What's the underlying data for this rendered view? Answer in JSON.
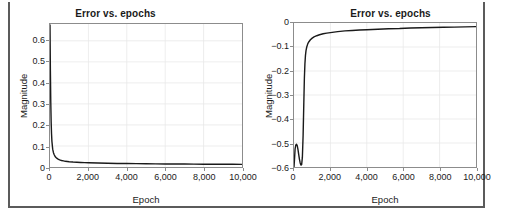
{
  "page": {
    "background_color": "#ffffff",
    "rule_color": "#5b5b5b"
  },
  "axis_color": "#8c8c8c",
  "grid_color": "#e8e8e8",
  "curve_color": "#1a1a1a",
  "figures": [
    {
      "id": "left",
      "title": "Error vs. epochs",
      "xlabel": "Epoch",
      "ylabel": "Magnitude",
      "xticks": [
        "0",
        "2,000",
        "4,000",
        "6,000",
        "8,000",
        "10,000"
      ],
      "yticks": [
        "0",
        "0.1",
        "0.2",
        "0.3",
        "0.4",
        "0.5",
        "0.6"
      ]
    },
    {
      "id": "right",
      "title": "Error vs. epochs",
      "xlabel": "Epoch",
      "ylabel": "Magnitude",
      "xticks": [
        "0",
        "2,000",
        "4,000",
        "6,000",
        "8,000",
        "10,000"
      ],
      "yticks": [
        "0",
        "−0.1",
        "−0.2",
        "−0.3",
        "−0.4",
        "−0.5",
        "−0.6"
      ]
    }
  ],
  "chart_data": [
    {
      "type": "line",
      "id": "left",
      "title": "Error vs. epochs",
      "xlabel": "Epoch",
      "ylabel": "Magnitude",
      "xlim": [
        0,
        10000
      ],
      "ylim": [
        0,
        0.68
      ],
      "xticks": [
        0,
        2000,
        4000,
        6000,
        8000,
        10000
      ],
      "yticks": [
        0,
        0.1,
        0.2,
        0.3,
        0.4,
        0.5,
        0.6
      ],
      "grid": true,
      "legend": null,
      "series": [
        {
          "name": "error",
          "x": [
            0,
            20,
            40,
            60,
            80,
            100,
            140,
            180,
            220,
            260,
            300,
            350,
            400,
            500,
            600,
            700,
            800,
            900,
            1000,
            1200,
            1400,
            1600,
            1800,
            2000,
            2500,
            3000,
            3500,
            4000,
            4500,
            5000,
            5500,
            6000,
            6500,
            7000,
            7500,
            8000,
            8500,
            9000,
            9500,
            10000
          ],
          "y": [
            0.675,
            0.46,
            0.31,
            0.215,
            0.158,
            0.122,
            0.085,
            0.068,
            0.058,
            0.051,
            0.046,
            0.042,
            0.039,
            0.034,
            0.031,
            0.029,
            0.027,
            0.026,
            0.025,
            0.0235,
            0.0225,
            0.0215,
            0.0207,
            0.02,
            0.0188,
            0.0178,
            0.017,
            0.0164,
            0.0159,
            0.0154,
            0.015,
            0.0146,
            0.0143,
            0.014,
            0.0137,
            0.0134,
            0.0132,
            0.013,
            0.0128,
            0.0126
          ]
        }
      ]
    },
    {
      "type": "line",
      "id": "right",
      "title": "Error vs. epochs",
      "xlabel": "Epoch",
      "ylabel": "Magnitude",
      "xlim": [
        0,
        10000
      ],
      "ylim": [
        -0.6,
        0.0
      ],
      "xticks": [
        0,
        2000,
        4000,
        6000,
        8000,
        10000
      ],
      "yticks": [
        0,
        -0.1,
        -0.2,
        -0.3,
        -0.4,
        -0.5,
        -0.6
      ],
      "grid": true,
      "legend": null,
      "series": [
        {
          "name": "error",
          "x": [
            0,
            30,
            60,
            100,
            140,
            180,
            220,
            260,
            300,
            340,
            380,
            420,
            460,
            500,
            540,
            570,
            600,
            630,
            660,
            700,
            760,
            820,
            900,
            1000,
            1100,
            1250,
            1400,
            1600,
            1800,
            2000,
            2400,
            2800,
            3200,
            3600,
            4000,
            4600,
            5200,
            5800,
            6400,
            7000,
            7600,
            8200,
            8800,
            9400,
            10000
          ],
          "y": [
            -0.6,
            -0.565,
            -0.525,
            -0.508,
            -0.505,
            -0.512,
            -0.528,
            -0.548,
            -0.568,
            -0.583,
            -0.592,
            -0.59,
            -0.56,
            -0.47,
            -0.33,
            -0.23,
            -0.17,
            -0.135,
            -0.115,
            -0.1,
            -0.086,
            -0.078,
            -0.07,
            -0.063,
            -0.058,
            -0.053,
            -0.049,
            -0.045,
            -0.042,
            -0.04,
            -0.036,
            -0.033,
            -0.031,
            -0.029,
            -0.028,
            -0.026,
            -0.024,
            -0.023,
            -0.021,
            -0.02,
            -0.019,
            -0.018,
            -0.017,
            -0.016,
            -0.015
          ]
        }
      ]
    }
  ]
}
